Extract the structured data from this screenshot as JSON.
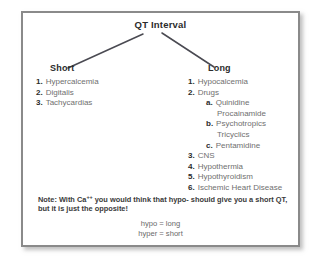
{
  "figure": {
    "title": "QT Interval",
    "branches": [
      {
        "heading": "Short",
        "items": [
          {
            "marker": "1.",
            "label": "Hypercalcemia"
          },
          {
            "marker": "2.",
            "label": "Digitalis"
          },
          {
            "marker": "3.",
            "label": "Tachycardias"
          }
        ]
      },
      {
        "heading": "Long",
        "items": [
          {
            "marker": "1.",
            "label": "Hypocalcemia"
          },
          {
            "marker": "2.",
            "label": "Drugs"
          },
          {
            "marker": "3.",
            "label": "CNS"
          },
          {
            "marker": "4.",
            "label": "Hypothermia"
          },
          {
            "marker": "5.",
            "label": "Hypothyroidism"
          },
          {
            "marker": "6.",
            "label": "Ischemic Heart Disease"
          }
        ],
        "subitems": [
          {
            "marker": "a.",
            "label": "Quinidine",
            "continuation": "Procainamide"
          },
          {
            "marker": "b.",
            "label": "Psychotropics",
            "continuation": "Tricyclics"
          },
          {
            "marker": "c.",
            "label": "Pentamidine",
            "continuation": ""
          }
        ]
      }
    ],
    "note": {
      "prefix": "Note: With Ca",
      "superscript": "++",
      "body": " you would think that hypo- should give you a short QT, but it is just the opposite!"
    },
    "equations": [
      "hypo = long",
      "hyper = short"
    ],
    "colors": {
      "frame_border": "#8a8a8a",
      "heading_text": "#2b2b2b",
      "body_text": "#6f6f6f",
      "note_text": "#3a3a3a",
      "line": "#4a4a52",
      "background": "#ffffff"
    }
  }
}
